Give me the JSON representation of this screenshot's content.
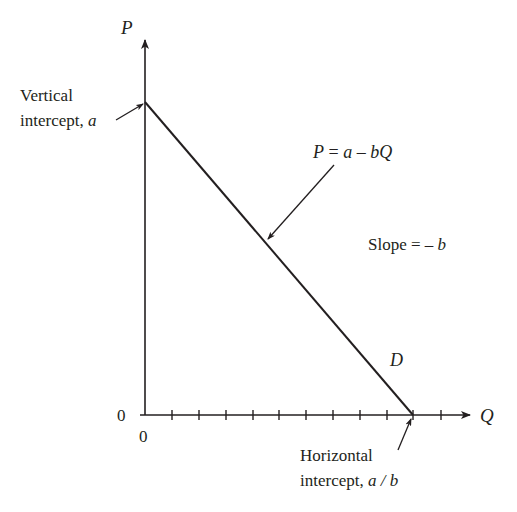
{
  "diagram": {
    "type": "linear-demand-curve",
    "axes": {
      "y_label": "P",
      "x_label": "Q",
      "y_origin_label": "0",
      "x_origin_label": "0",
      "x_tick_count": 11
    },
    "curve": {
      "label": "D",
      "equation": {
        "lhs": "P",
        "eq": " = ",
        "a": "a",
        "minus": " – ",
        "bQ": "bQ"
      }
    },
    "annotations": {
      "vertical_intercept": {
        "line1": "Vertical",
        "line2_text": "intercept, ",
        "line2_var": "a"
      },
      "horizontal_intercept": {
        "line1": "Horizontal",
        "line2_text": "intercept, ",
        "line2_var": "a / b"
      },
      "slope": {
        "text": "Slope = – ",
        "var": "b"
      }
    },
    "colors": {
      "ink": "#231f20",
      "background": "#ffffff"
    }
  }
}
